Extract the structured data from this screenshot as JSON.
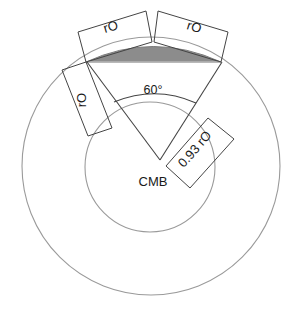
{
  "diagram": {
    "type": "technical-geometry-diagram",
    "canvas": {
      "width": 295,
      "height": 313,
      "background": "#ffffff"
    },
    "colors": {
      "circle_stroke": "#9a9a9a",
      "construction_stroke": "#444444",
      "lens_fill": "#8c8c8c",
      "lens_stroke": "#7a7a7a",
      "text": "#1a1a1a"
    },
    "labels": {
      "center": "CMB",
      "angle": "60°",
      "dim_top_left": "rO",
      "dim_top_right": "rO",
      "dim_left": "rO",
      "dim_right": "0.93 rO"
    },
    "geometry": {
      "outer_circle": {
        "cx": 151,
        "cy": 166,
        "r": 129
      },
      "inner_circle": {
        "cx": 150,
        "cy": 167,
        "r": 65
      },
      "apex": {
        "x": 160,
        "y": 160
      },
      "wedge_left_end": {
        "x": 87,
        "y": 62
      },
      "wedge_right_end": {
        "x": 222,
        "y": 62
      },
      "angle_value": 60,
      "angle_unit": "degrees",
      "lens_left": {
        "x": 86,
        "y": 62
      },
      "lens_right": {
        "x": 221,
        "y": 62
      },
      "lens_peak": {
        "x": 153,
        "y": 42
      },
      "radius_label_outer": "rO",
      "radius_label_inner": "0.93 rO"
    }
  }
}
